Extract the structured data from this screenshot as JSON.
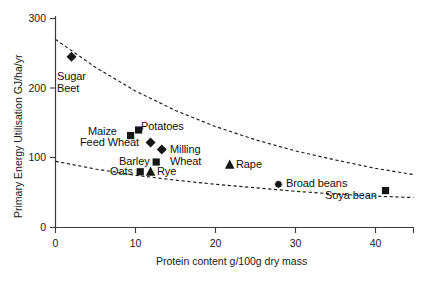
{
  "chart_data": {
    "type": "scatter",
    "title": "",
    "xlabel": "Protein content g/100g dry mass",
    "ylabel": "Primary Energy Utilisation GJ/ha/yr",
    "xlim": [
      0,
      44.8
    ],
    "ylim": [
      0,
      300
    ],
    "xticks": [
      0,
      10,
      20,
      30,
      40
    ],
    "yticks": [
      0,
      100,
      200,
      300
    ],
    "grid": false,
    "legend": "none (points labelled directly)",
    "points": [
      {
        "label": "Sugar Beet",
        "x": 2.0,
        "y": 245,
        "marker": "diamond"
      },
      {
        "label": "Maize",
        "x": 9.4,
        "y": 132,
        "marker": "square"
      },
      {
        "label": "Potatoes",
        "x": 10.4,
        "y": 140,
        "marker": "square"
      },
      {
        "label": "Feed Wheat",
        "x": 11.9,
        "y": 122,
        "marker": "diamond"
      },
      {
        "label": "Milling Wheat",
        "x": 13.3,
        "y": 112,
        "marker": "diamond"
      },
      {
        "label": "Barley",
        "x": 12.6,
        "y": 94,
        "marker": "square"
      },
      {
        "label": "Oats",
        "x": 10.6,
        "y": 80,
        "marker": "square"
      },
      {
        "label": "Rye",
        "x": 11.9,
        "y": 80,
        "marker": "triangle"
      },
      {
        "label": "Rape",
        "x": 21.8,
        "y": 90,
        "marker": "triangle"
      },
      {
        "label": "Broad beans",
        "x": 27.9,
        "y": 62,
        "marker": "circle"
      },
      {
        "label": "Soya bean",
        "x": 41.3,
        "y": 53,
        "marker": "square"
      }
    ],
    "curves": [
      {
        "name": "upper-boundary",
        "x": [
          0,
          5,
          10,
          15,
          20,
          25,
          30,
          35,
          40,
          44.8
        ],
        "y": [
          270,
          230,
          196,
          168,
          145,
          126,
          110,
          97,
          85,
          76
        ]
      },
      {
        "name": "lower-boundary",
        "x": [
          0,
          5,
          10,
          15,
          20,
          25,
          30,
          35,
          40,
          44.8
        ],
        "y": [
          95,
          84,
          75,
          68,
          62,
          57,
          52,
          48,
          45,
          43
        ]
      }
    ]
  },
  "labels": {
    "sugar_beet": "Sugar\nBeet",
    "sugar_beet_line1": "Sugar",
    "sugar_beet_line2": "Beet",
    "maize": "Maize",
    "potatoes": "Potatoes",
    "feed_wheat": "Feed Wheat",
    "milling_line1": "Milling",
    "milling_line2": "Wheat",
    "barley": "Barley",
    "oats": "Oats",
    "rye": "Rye",
    "rape": "Rape",
    "broad_beans": "Broad beans",
    "soya_bean": "Soya bean"
  },
  "axes": {
    "x_title": "Protein content g/100g dry mass",
    "y_title": "Primary Energy Utilisation GJ/ha/yr",
    "x_tick_labels": [
      "0",
      "10",
      "20",
      "30",
      "40"
    ],
    "y_tick_labels": [
      "0",
      "100",
      "200",
      "300"
    ]
  },
  "colors": {
    "marker": "#161616",
    "axis": "#3a3a3a",
    "curve": "#1b1b1b",
    "background": "#ffffff",
    "text": "#111111"
  }
}
